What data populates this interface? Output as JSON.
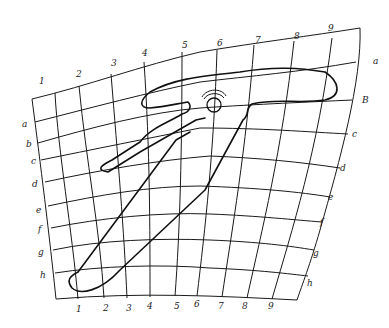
{
  "diagram": {
    "type": "hand-drawn distorted coordinate grid with traced outline",
    "colors": {
      "ink": "#1a1a1a",
      "background": "#ffffff"
    },
    "column_labels_top": [
      {
        "text": "1",
        "x": 39,
        "y": 84
      },
      {
        "text": "2",
        "x": 78,
        "y": 77
      },
      {
        "text": "3",
        "x": 113,
        "y": 66
      },
      {
        "text": "4",
        "x": 144,
        "y": 56
      },
      {
        "text": "5",
        "x": 184,
        "y": 49
      },
      {
        "text": "6",
        "x": 219,
        "y": 46
      },
      {
        "text": "7",
        "x": 258,
        "y": 43
      },
      {
        "text": "8",
        "x": 296,
        "y": 39
      },
      {
        "text": "9",
        "x": 330,
        "y": 31
      }
    ],
    "column_labels_bottom": [
      {
        "text": "1",
        "x": 78,
        "y": 311
      },
      {
        "text": "2",
        "x": 105,
        "y": 310
      },
      {
        "text": "3",
        "x": 128,
        "y": 310
      },
      {
        "text": "4",
        "x": 149,
        "y": 308
      },
      {
        "text": "5",
        "x": 176,
        "y": 308
      },
      {
        "text": "6",
        "x": 196,
        "y": 306
      },
      {
        "text": "7",
        "x": 220,
        "y": 308
      },
      {
        "text": "8",
        "x": 244,
        "y": 308
      },
      {
        "text": "9",
        "x": 270,
        "y": 308
      }
    ],
    "row_labels_left": [
      {
        "text": "a",
        "x": 24,
        "y": 126
      },
      {
        "text": "b",
        "x": 28,
        "y": 146
      },
      {
        "text": "c",
        "x": 34,
        "y": 163
      },
      {
        "text": "d",
        "x": 34,
        "y": 186
      },
      {
        "text": "e",
        "x": 38,
        "y": 212
      },
      {
        "text": "f",
        "x": 40,
        "y": 231
      },
      {
        "text": "g",
        "x": 40,
        "y": 254
      },
      {
        "text": "h",
        "x": 42,
        "y": 277
      }
    ],
    "row_labels_right": [
      {
        "text": "a",
        "x": 375,
        "y": 64
      },
      {
        "text": "B",
        "x": 363,
        "y": 103
      },
      {
        "text": "c",
        "x": 353,
        "y": 137
      },
      {
        "text": "d",
        "x": 340,
        "y": 171
      },
      {
        "text": "e",
        "x": 328,
        "y": 200
      },
      {
        "text": "f",
        "x": 320,
        "y": 224
      },
      {
        "text": "g",
        "x": 313,
        "y": 256
      },
      {
        "text": "h",
        "x": 307,
        "y": 286
      }
    ]
  }
}
